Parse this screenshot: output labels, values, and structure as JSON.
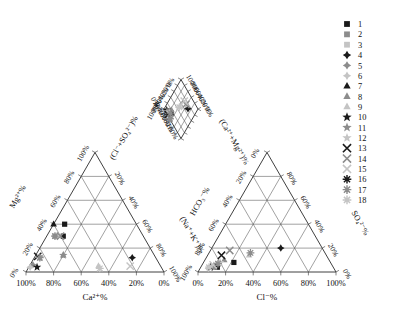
{
  "figure": {
    "type": "piper-diagram",
    "title": "",
    "background_color": "#ffffff",
    "line_color": "#2a2a2a",
    "grid_color": "#555555"
  },
  "cation_triangle": {
    "name": "cation-triangle",
    "bottom_axis_title": "Ca²⁺%",
    "left_axis_title": "Mg²⁺%",
    "right_axis_title": "(Na⁺+K⁺)%",
    "bottom_ticks": [
      "100%",
      "80%",
      "60%",
      "40%",
      "20%",
      "0%"
    ],
    "left_ticks": [
      "0%",
      "20%",
      "40%",
      "60%",
      "80%",
      "100%"
    ],
    "right_ticks": [
      "20%",
      "40%",
      "60%",
      "80%",
      "100%"
    ]
  },
  "anion_triangle": {
    "name": "anion-triangle",
    "bottom_axis_title": "Cl⁻%",
    "left_axis_title": "HCO₃⁻%",
    "right_axis_title": "SO₄²⁻%",
    "bottom_ticks": [
      "0%",
      "20%",
      "40%",
      "60%",
      "80%",
      "100%"
    ],
    "left_ticks": [
      "100%",
      "80%",
      "60%",
      "40%",
      "20%",
      "0%"
    ],
    "right_ticks": [
      "80%",
      "60%",
      "40%",
      "20%",
      "0%"
    ]
  },
  "diamond": {
    "name": "diamond-field",
    "left_axis_title": "(Cl⁻+SO₄²⁻)%",
    "right_axis_title": "(Ca²⁺+Mg²⁺)%",
    "left_lower_ticks": [
      "0%",
      "20%",
      "40%",
      "60%",
      "80%",
      "100%"
    ],
    "left_upper_ticks": [
      "100%",
      "80%",
      "60%",
      "40%",
      "20%",
      "0%"
    ],
    "right_upper_ticks": [
      "100%",
      "80%",
      "60%",
      "40%",
      "20%",
      "0%"
    ],
    "right_lower_ticks": [
      "100%",
      "80%",
      "60%",
      "40%",
      "20%",
      "0%"
    ]
  },
  "legend": {
    "name": "sample-legend",
    "items": [
      {
        "label": "1",
        "symbol": "square",
        "color": "#1a1a1a"
      },
      {
        "label": "2",
        "symbol": "square",
        "color": "#8c8c8c"
      },
      {
        "label": "3",
        "symbol": "square",
        "color": "#c4c4c4"
      },
      {
        "label": "4",
        "symbol": "diamond",
        "color": "#1a1a1a"
      },
      {
        "label": "5",
        "symbol": "diamond",
        "color": "#8c8c8c"
      },
      {
        "label": "6",
        "symbol": "diamond",
        "color": "#c4c4c4"
      },
      {
        "label": "7",
        "symbol": "triangle",
        "color": "#1a1a1a"
      },
      {
        "label": "8",
        "symbol": "triangle",
        "color": "#8c8c8c"
      },
      {
        "label": "9",
        "symbol": "triangle",
        "color": "#c4c4c4"
      },
      {
        "label": "10",
        "symbol": "star",
        "color": "#1a1a1a"
      },
      {
        "label": "11",
        "symbol": "star",
        "color": "#8c8c8c"
      },
      {
        "label": "12",
        "symbol": "star",
        "color": "#c4c4c4"
      },
      {
        "label": "13",
        "symbol": "cross",
        "color": "#1a1a1a"
      },
      {
        "label": "14",
        "symbol": "cross",
        "color": "#8c8c8c"
      },
      {
        "label": "15",
        "symbol": "cross",
        "color": "#c4c4c4"
      },
      {
        "label": "16",
        "symbol": "asterisk",
        "color": "#1a1a1a"
      },
      {
        "label": "17",
        "symbol": "asterisk",
        "color": "#8c8c8c"
      },
      {
        "label": "18",
        "symbol": "asterisk",
        "color": "#c4c4c4"
      }
    ]
  },
  "chart_data": {
    "type": "scatter",
    "title": "",
    "xlabel": "",
    "ylabel": "",
    "plot_kind": "piper-trilinear",
    "series_count": 18,
    "cation_points": [
      {
        "id": "1",
        "ca": 52,
        "mg": 40,
        "nak": 8,
        "symbol": "square",
        "color": "#1a1a1a"
      },
      {
        "id": "2",
        "ca": 58,
        "mg": 30,
        "nak": 12,
        "symbol": "square",
        "color": "#1a1a1a"
      },
      {
        "id": "3",
        "ca": 64,
        "mg": 30,
        "nak": 6,
        "symbol": "square",
        "color": "#8c8c8c"
      },
      {
        "id": "4",
        "ca": 17,
        "mg": 12,
        "nak": 71,
        "symbol": "diamond",
        "color": "#1a1a1a"
      },
      {
        "id": "5",
        "ca": 92,
        "mg": 6,
        "nak": 2,
        "symbol": "diamond",
        "color": "#8c8c8c"
      },
      {
        "id": "6",
        "ca": 95,
        "mg": 4,
        "nak": 1,
        "symbol": "diamond",
        "color": "#c4c4c4"
      },
      {
        "id": "7",
        "ca": 60,
        "mg": 40,
        "nak": 0,
        "symbol": "triangle",
        "color": "#1a1a1a"
      },
      {
        "id": "8",
        "ca": 66,
        "mg": 14,
        "nak": 20,
        "symbol": "triangle",
        "color": "#8c8c8c"
      },
      {
        "id": "9",
        "ca": 45,
        "mg": 5,
        "nak": 50,
        "symbol": "triangle",
        "color": "#c4c4c4"
      },
      {
        "id": "10",
        "ca": 90,
        "mg": 4,
        "nak": 6,
        "symbol": "star",
        "color": "#1a1a1a"
      },
      {
        "id": "11",
        "ca": 84,
        "mg": 12,
        "nak": 4,
        "symbol": "star",
        "color": "#8c8c8c"
      },
      {
        "id": "12",
        "ca": 66,
        "mg": 14,
        "nak": 20,
        "symbol": "star",
        "color": "#8c8c8c"
      },
      {
        "id": "13",
        "ca": 85,
        "mg": 13,
        "nak": 2,
        "symbol": "cross",
        "color": "#1a1a1a"
      },
      {
        "id": "14",
        "ca": 22,
        "mg": 5,
        "nak": 73,
        "symbol": "cross",
        "color": "#c4c4c4"
      },
      {
        "id": "15",
        "ca": 60,
        "mg": 30,
        "nak": 10,
        "symbol": "cross",
        "color": "#8c8c8c"
      },
      {
        "id": "16",
        "ca": 64,
        "mg": 30,
        "nak": 6,
        "symbol": "asterisk",
        "color": "#8c8c8c"
      },
      {
        "id": "17",
        "ca": 84,
        "mg": 12,
        "nak": 4,
        "symbol": "asterisk",
        "color": "#8c8c8c"
      },
      {
        "id": "18",
        "ca": 45,
        "mg": 3,
        "nak": 52,
        "symbol": "asterisk",
        "color": "#c4c4c4"
      }
    ],
    "anion_points": [
      {
        "id": "1",
        "cl": 22,
        "so4": 8,
        "hco3": 70,
        "symbol": "square",
        "color": "#1a1a1a"
      },
      {
        "id": "2",
        "cl": 12,
        "so4": 4,
        "hco3": 84,
        "symbol": "square",
        "color": "#1a1a1a"
      },
      {
        "id": "3",
        "cl": 10,
        "so4": 4,
        "hco3": 86,
        "symbol": "square",
        "color": "#8c8c8c"
      },
      {
        "id": "4",
        "cl": 50,
        "so4": 20,
        "hco3": 30,
        "symbol": "diamond",
        "color": "#1a1a1a"
      },
      {
        "id": "5",
        "cl": 8,
        "so4": 4,
        "hco3": 88,
        "symbol": "diamond",
        "color": "#8c8c8c"
      },
      {
        "id": "6",
        "cl": 6,
        "so4": 3,
        "hco3": 91,
        "symbol": "diamond",
        "color": "#c4c4c4"
      },
      {
        "id": "7",
        "cl": 10,
        "so4": 6,
        "hco3": 84,
        "symbol": "triangle",
        "color": "#1a1a1a"
      },
      {
        "id": "8",
        "cl": 14,
        "so4": 10,
        "hco3": 76,
        "symbol": "triangle",
        "color": "#8c8c8c"
      },
      {
        "id": "9",
        "cl": 30,
        "so4": 14,
        "hco3": 56,
        "symbol": "triangle",
        "color": "#c4c4c4"
      },
      {
        "id": "10",
        "cl": 7,
        "so4": 4,
        "hco3": 89,
        "symbol": "star",
        "color": "#1a1a1a"
      },
      {
        "id": "11",
        "cl": 9,
        "so4": 5,
        "hco3": 86,
        "symbol": "star",
        "color": "#8c8c8c"
      },
      {
        "id": "12",
        "cl": 12,
        "so4": 8,
        "hco3": 80,
        "symbol": "star",
        "color": "#c4c4c4"
      },
      {
        "id": "13",
        "cl": 10,
        "so4": 14,
        "hco3": 76,
        "symbol": "cross",
        "color": "#1a1a1a"
      },
      {
        "id": "14",
        "cl": 14,
        "so4": 18,
        "hco3": 68,
        "symbol": "cross",
        "color": "#8c8c8c"
      },
      {
        "id": "15",
        "cl": 8,
        "so4": 6,
        "hco3": 86,
        "symbol": "cross",
        "color": "#c4c4c4"
      },
      {
        "id": "16",
        "cl": 30,
        "so4": 16,
        "hco3": 54,
        "symbol": "asterisk",
        "color": "#8c8c8c"
      },
      {
        "id": "17",
        "cl": 11,
        "so4": 7,
        "hco3": 82,
        "symbol": "asterisk",
        "color": "#8c8c8c"
      },
      {
        "id": "18",
        "cl": 6,
        "so4": 4,
        "hco3": 90,
        "symbol": "asterisk",
        "color": "#c4c4c4"
      }
    ],
    "diamond_points": [
      {
        "id": "1",
        "x_clso4": 28,
        "y_camg": 86,
        "symbol": "square",
        "color": "#1a1a1a"
      },
      {
        "id": "2",
        "x_clso4": 16,
        "y_camg": 90,
        "symbol": "square",
        "color": "#1a1a1a"
      },
      {
        "id": "3",
        "x_clso4": 14,
        "y_camg": 92,
        "symbol": "square",
        "color": "#8c8c8c"
      },
      {
        "id": "4",
        "x_clso4": 70,
        "y_camg": 29,
        "symbol": "diamond",
        "color": "#1a1a1a"
      },
      {
        "id": "5",
        "x_clso4": 11,
        "y_camg": 96,
        "symbol": "diamond",
        "color": "#8c8c8c"
      },
      {
        "id": "6",
        "x_clso4": 8,
        "y_camg": 97,
        "symbol": "diamond",
        "color": "#c4c4c4"
      },
      {
        "id": "7",
        "x_clso4": 15,
        "y_camg": 99,
        "symbol": "triangle",
        "color": "#1a1a1a"
      },
      {
        "id": "8",
        "x_clso4": 23,
        "y_camg": 80,
        "symbol": "triangle",
        "color": "#8c8c8c"
      },
      {
        "id": "9",
        "x_clso4": 42,
        "y_camg": 50,
        "symbol": "triangle",
        "color": "#c4c4c4"
      },
      {
        "id": "10",
        "x_clso4": 10,
        "y_camg": 94,
        "symbol": "star",
        "color": "#1a1a1a"
      },
      {
        "id": "11",
        "x_clso4": 13,
        "y_camg": 95,
        "symbol": "star",
        "color": "#8c8c8c"
      },
      {
        "id": "12",
        "x_clso4": 20,
        "y_camg": 90,
        "symbol": "star",
        "color": "#c4c4c4"
      },
      {
        "id": "13",
        "x_clso4": 22,
        "y_camg": 97,
        "symbol": "cross",
        "color": "#1a1a1a"
      },
      {
        "id": "14",
        "x_clso4": 56,
        "y_camg": 28,
        "symbol": "cross",
        "color": "#8c8c8c"
      },
      {
        "id": "15",
        "x_clso4": 46,
        "y_camg": 27,
        "symbol": "cross",
        "color": "#c4c4c4"
      },
      {
        "id": "16",
        "x_clso4": 34,
        "y_camg": 99,
        "symbol": "asterisk",
        "color": "#8c8c8c"
      },
      {
        "id": "17",
        "x_clso4": 26,
        "y_camg": 88,
        "symbol": "asterisk",
        "color": "#8c8c8c"
      },
      {
        "id": "18",
        "x_clso4": 42,
        "y_camg": 52,
        "symbol": "asterisk",
        "color": "#c4c4c4"
      }
    ]
  }
}
